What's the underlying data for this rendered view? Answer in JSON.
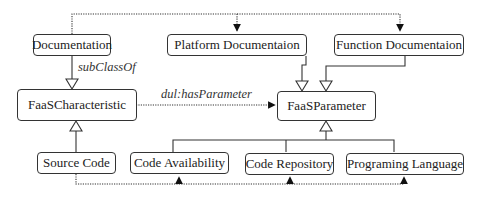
{
  "diagram": {
    "nodes": {
      "documentation": "Documentation",
      "platform_documentation": "Platform Documentaion",
      "function_documentation": "Function Documentaion",
      "faas_characteristic": "FaaSCharacteristic",
      "faas_parameter": "FaaSParameter",
      "source_code": "Source Code",
      "code_availability": "Code Availability",
      "code_repository": "Code Repository",
      "programing_language": "Programing Language"
    },
    "edge_labels": {
      "subclass_of": "subClassOf",
      "has_parameter": "dul:hasParameter"
    },
    "edges": [
      {
        "from": "Documentation",
        "to": "FaaSCharacteristic",
        "type": "subClassOf"
      },
      {
        "from": "Platform Documentaion",
        "to": "FaaSParameter",
        "type": "subClassOf"
      },
      {
        "from": "Function Documentaion",
        "to": "FaaSParameter",
        "type": "subClassOf"
      },
      {
        "from": "Source Code",
        "to": "FaaSCharacteristic",
        "type": "subClassOf"
      },
      {
        "from": "Code Availability",
        "to": "FaaSParameter",
        "type": "subClassOf"
      },
      {
        "from": "Code Repository",
        "to": "FaaSParameter",
        "type": "subClassOf"
      },
      {
        "from": "Programing Language",
        "to": "FaaSParameter",
        "type": "subClassOf"
      },
      {
        "from": "FaaSCharacteristic",
        "to": "FaaSParameter",
        "type": "dul:hasParameter"
      },
      {
        "from": "Documentation",
        "to": "Platform Documentaion",
        "type": "dotted"
      },
      {
        "from": "Documentation",
        "to": "Function Documentaion",
        "type": "dotted"
      },
      {
        "from": "Source Code",
        "to": "Code Availability",
        "type": "dotted"
      },
      {
        "from": "Source Code",
        "to": "Code Repository",
        "type": "dotted"
      },
      {
        "from": "Source Code",
        "to": "Programing Language",
        "type": "dotted"
      }
    ]
  }
}
